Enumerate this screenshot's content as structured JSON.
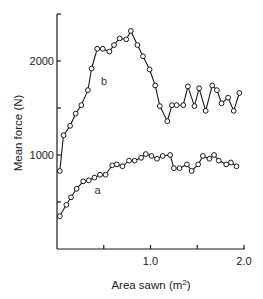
{
  "chart_data": {
    "type": "line",
    "title": "",
    "xlabel": "Area sawn (m²)",
    "xlabel_base": "Area sawn (m",
    "xlabel_sup": "2",
    "xlabel_end": ")",
    "ylabel": "Mean force (N)",
    "xlim": [
      0,
      2.0
    ],
    "ylim": [
      0,
      2500
    ],
    "grid": false,
    "legend": "none (inline labels 'a' and 'b')",
    "x_ticks": [
      0.5,
      1.0,
      1.5,
      2.0
    ],
    "x_tick_labels": [
      {
        "value": 1.0,
        "label": "1.0"
      },
      {
        "value": 2.0,
        "label": "2.0"
      }
    ],
    "y_ticks": [
      500,
      1000,
      1500,
      2000
    ],
    "y_tick_labels": [
      {
        "value": 1000,
        "label": "1000"
      },
      {
        "value": 2000,
        "label": "2000"
      }
    ],
    "marker": "open-circle",
    "series": [
      {
        "name": "b",
        "label_pos": {
          "x": 0.47,
          "y": 1750
        },
        "x": [
          0.03,
          0.07,
          0.14,
          0.2,
          0.26,
          0.33,
          0.37,
          0.43,
          0.49,
          0.56,
          0.61,
          0.67,
          0.74,
          0.79,
          0.86,
          0.92,
          0.99,
          1.05,
          1.1,
          1.18,
          1.23,
          1.28,
          1.35,
          1.4,
          1.47,
          1.52,
          1.59,
          1.66,
          1.71,
          1.76,
          1.83,
          1.89,
          1.95
        ],
        "values": [
          830,
          1210,
          1310,
          1440,
          1530,
          1690,
          1920,
          2130,
          2130,
          2100,
          2170,
          2240,
          2230,
          2320,
          2170,
          2050,
          1910,
          1740,
          1520,
          1360,
          1530,
          1530,
          1530,
          1730,
          1520,
          1710,
          1470,
          1740,
          1690,
          1550,
          1610,
          1470,
          1660
        ]
      },
      {
        "name": "a",
        "label_pos": {
          "x": 0.4,
          "y": 580
        },
        "x": [
          0.03,
          0.1,
          0.15,
          0.21,
          0.28,
          0.34,
          0.4,
          0.46,
          0.52,
          0.59,
          0.64,
          0.7,
          0.77,
          0.83,
          0.9,
          0.95,
          1.01,
          1.07,
          1.13,
          1.21,
          1.25,
          1.31,
          1.39,
          1.44,
          1.51,
          1.56,
          1.63,
          1.68,
          1.73,
          1.81,
          1.86,
          1.92
        ],
        "values": [
          350,
          470,
          550,
          640,
          720,
          730,
          760,
          790,
          790,
          890,
          900,
          880,
          940,
          940,
          970,
          1010,
          990,
          960,
          990,
          1000,
          860,
          860,
          900,
          830,
          900,
          990,
          960,
          1000,
          940,
          900,
          920,
          880
        ]
      }
    ]
  },
  "layout": {
    "plot_left_px": 57,
    "plot_bottom_px": 249,
    "px_per_x_unit": 93.5,
    "px_per_y_unit": 0.094,
    "axis_top_px": 14,
    "axis_right_px": 245
  },
  "colors": {
    "line": "#1a1a1a",
    "marker_fill": "#ffffff",
    "axis": "#1a1a1a"
  }
}
